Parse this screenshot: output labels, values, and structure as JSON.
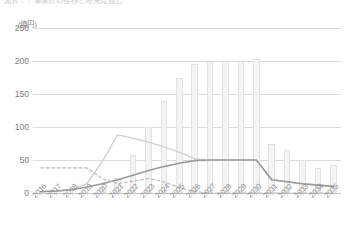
{
  "title": {
    "text": "図表 ○○ 事業費の推移と将来見通し",
    "visible_note": "clipped at top edge"
  },
  "axis": {
    "unit_label": "(億円)",
    "y_ticks": [
      0,
      50,
      100,
      150,
      200,
      250
    ],
    "y_min": 0,
    "y_max": 250
  },
  "chart_data": {
    "type": "bar",
    "title": "図表 ○○ 事業費の推移と将来見通し",
    "xlabel": "",
    "ylabel": "(億円)",
    "ylim": [
      0,
      250
    ],
    "grid": true,
    "legend_position": "none",
    "categories": [
      "2016",
      "2017",
      "2018",
      "2019",
      "2020",
      "2021",
      "2022",
      "2023",
      "2024",
      "2025",
      "2026",
      "2027",
      "2028",
      "2029",
      "2030",
      "2031",
      "2032",
      "2033",
      "2034",
      "2035"
    ],
    "series": [
      {
        "name": "事業費（棒）",
        "type": "bar",
        "values": [
          0,
          0,
          0,
          0,
          8,
          23,
          58,
          100,
          140,
          175,
          196,
          198,
          200,
          200,
          203,
          75,
          65,
          50,
          38,
          42
        ]
      },
      {
        "name": "収入見通し（実線・淡）",
        "type": "line",
        "style": "solid",
        "values": [
          2,
          3,
          5,
          14,
          48,
          88,
          83,
          77,
          70,
          62,
          52,
          50,
          50,
          50,
          50,
          20,
          17,
          14,
          12,
          10
        ]
      },
      {
        "name": "累積残高（実線・濃）",
        "type": "line",
        "style": "solid",
        "values": [
          2,
          3,
          5,
          9,
          14,
          20,
          27,
          34,
          40,
          45,
          49,
          50,
          50,
          50,
          50,
          20,
          17,
          14,
          12,
          10
        ]
      },
      {
        "name": "基準値（破線）",
        "type": "line",
        "style": "dashed",
        "values": [
          38,
          38,
          38,
          38,
          22,
          14,
          18,
          22,
          17,
          8,
          2,
          0,
          0,
          0,
          0,
          0,
          0,
          0,
          0,
          0
        ]
      }
    ]
  },
  "colors": {
    "bar_fill": "#f4f4f4",
    "bar_stroke": "#e3e3e3",
    "line_light": "#d2d2d2",
    "line_dark": "#9a9a9a",
    "line_dashed": "#bdbdbd",
    "grid": "#dcdcdc",
    "text": "#7d7d7d"
  }
}
